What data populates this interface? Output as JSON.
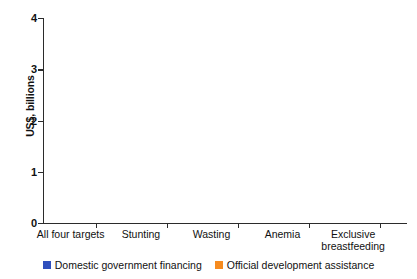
{
  "chart_data": {
    "type": "bar",
    "stacked": true,
    "title": "",
    "subtitle": "",
    "xlabel": "",
    "ylabel": "US$, billions",
    "ylim": [
      0,
      4
    ],
    "yticks": [
      0,
      1,
      2,
      3,
      4
    ],
    "ytick_labels": [
      "0",
      "1",
      "2",
      "3",
      "4"
    ],
    "grid": false,
    "legend_position": "bottom",
    "categories": [
      "All four targets",
      "Stunting",
      "Wasting",
      "Anemia",
      "Exclusive breastfeeding"
    ],
    "series": [
      {
        "name": "Official development assistance",
        "color": "#F68B1F",
        "values": [
          1.0,
          0.35,
          0.53,
          0.08,
          0.05
        ]
      },
      {
        "name": "Domestic government financing",
        "color": "#2F4FBD",
        "values": [
          2.96,
          2.25,
          0.07,
          0.52,
          0.28
        ]
      }
    ],
    "totals": [
      3.96,
      2.6,
      0.6,
      0.6,
      0.33
    ]
  },
  "axes": {
    "y_title": "US$, billions",
    "y_tick_labels": [
      "4",
      "3",
      "2",
      "1",
      "0"
    ]
  },
  "categories": [
    {
      "label": "All four targets"
    },
    {
      "label": "Stunting"
    },
    {
      "label": "Wasting"
    },
    {
      "label": "Anemia"
    },
    {
      "label": "Exclusive\nbreastfeeding"
    }
  ],
  "legend": {
    "items": [
      {
        "label": "Domestic government financing",
        "color": "#2F4FBD"
      },
      {
        "label": "Official development assistance",
        "color": "#F68B1F"
      }
    ]
  },
  "colors": {
    "domestic_government_financing": "#2F4FBD",
    "official_development_assistance": "#F68B1F",
    "axis": "#2b2b2b",
    "text": "#111111",
    "background": "#ffffff"
  }
}
